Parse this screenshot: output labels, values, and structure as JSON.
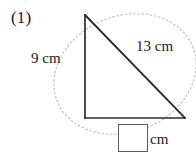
{
  "problem": {
    "number": "(1)",
    "unit_label": "cm"
  },
  "figure": {
    "type": "right-triangle-with-arc",
    "apex": {
      "x": 85,
      "y": 15
    },
    "bottom_left": {
      "x": 85,
      "y": 118
    },
    "bottom_right": {
      "x": 185,
      "y": 118
    },
    "line_color": "#2b2b2b",
    "arc_color": "#b5b5b5",
    "arc_style": "dotted"
  },
  "labels": {
    "left_side": "9 cm",
    "hypotenuse": "13 cm",
    "bottom_unit": "cm"
  },
  "answer": {
    "value": "",
    "placeholder": ""
  }
}
